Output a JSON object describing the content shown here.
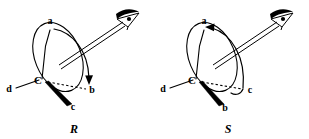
{
  "figure": {
    "background_color": "#ffffff",
    "ink_color": "#000000",
    "width": 309,
    "height": 139
  },
  "structures": [
    {
      "id": "r-structure",
      "config_label": "R",
      "center_atom": "C",
      "rotation_sense": "clockwise",
      "substituents": [
        {
          "key": "a",
          "label": "a",
          "priority": 1,
          "bond_type": "plain",
          "position": "up"
        },
        {
          "key": "b",
          "label": "b",
          "priority": 2,
          "bond_type": "dashed",
          "position": "right"
        },
        {
          "key": "c",
          "label": "c",
          "priority": 3,
          "bond_type": "wedge",
          "position": "down"
        },
        {
          "key": "d",
          "label": "d",
          "priority": 4,
          "bond_type": "plain",
          "position": "left-rear"
        }
      ],
      "viewer": {
        "icon": "eye-icon",
        "axis": "along C-d bond extended, viewing from opposite d"
      }
    },
    {
      "id": "s-structure",
      "config_label": "S",
      "center_atom": "C",
      "rotation_sense": "counterclockwise",
      "substituents": [
        {
          "key": "a",
          "label": "a",
          "priority": 1,
          "bond_type": "plain",
          "position": "up"
        },
        {
          "key": "b",
          "label": "b",
          "priority": 2,
          "bond_type": "wedge",
          "position": "down"
        },
        {
          "key": "c",
          "label": "c",
          "priority": 3,
          "bond_type": "dashed",
          "position": "right"
        },
        {
          "key": "d",
          "label": "d",
          "priority": 4,
          "bond_type": "plain",
          "position": "left-rear"
        }
      ],
      "viewer": {
        "icon": "eye-icon",
        "axis": "along C-d bond extended, viewing from opposite d"
      }
    }
  ]
}
